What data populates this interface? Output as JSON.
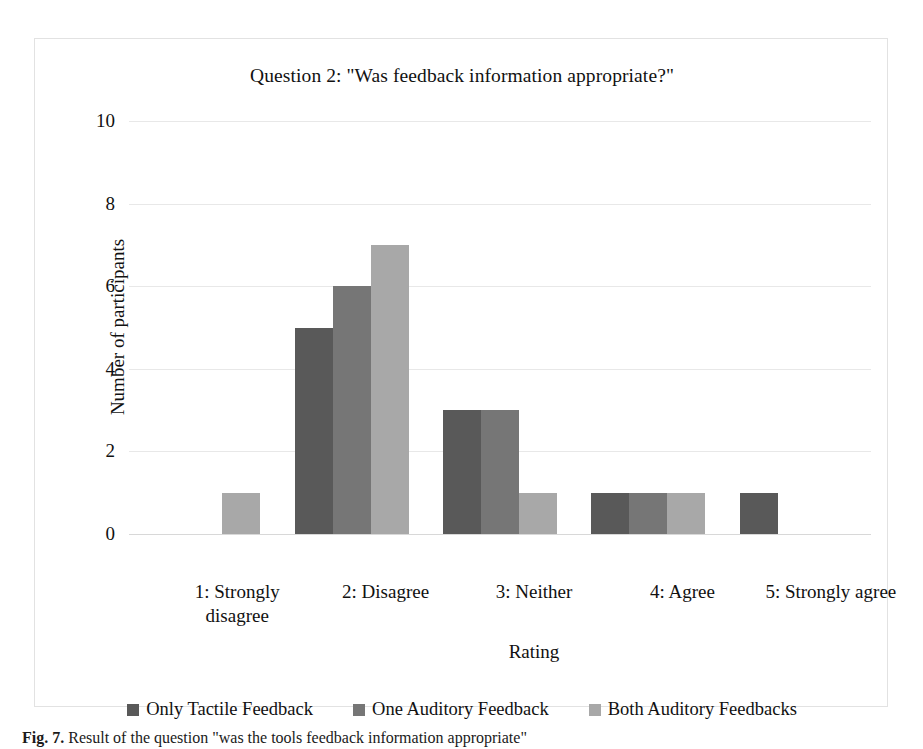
{
  "chart_data": {
    "type": "bar",
    "title": "Question 2: \"Was feedback information appropriate?\"",
    "xlabel": "Rating",
    "ylabel": "Number of participants",
    "ylim": [
      0,
      10
    ],
    "yticks": [
      0,
      2,
      4,
      6,
      8,
      10
    ],
    "grid": true,
    "legend_position": "bottom",
    "categories": [
      "1: Strongly\ndisagree",
      "2: Disagree",
      "3: Neither",
      "4: Agree",
      "5: Strongly agree"
    ],
    "series": [
      {
        "name": "Only Tactile Feedback",
        "color": "#595959",
        "values": [
          0,
          5,
          3,
          1,
          1
        ]
      },
      {
        "name": "One Auditory Feedback",
        "color": "#767676",
        "values": [
          0,
          6,
          3,
          1,
          0
        ]
      },
      {
        "name": "Both Auditory Feedbacks",
        "color": "#a8a8a8",
        "values": [
          1,
          7,
          1,
          1,
          0
        ]
      }
    ]
  },
  "caption": {
    "label": "Fig. 7.",
    "text": "Result of the question \"was the tools feedback information appropriate\""
  }
}
